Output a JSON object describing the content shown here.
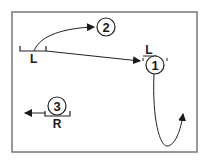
{
  "diagram": {
    "type": "play-diagram",
    "frame": {
      "x": 12,
      "y": 12,
      "width": 185,
      "height": 140,
      "stroke": "#777777"
    },
    "players": [
      {
        "id": "1",
        "label": "1",
        "cx": 155,
        "cy": 65,
        "r": 9,
        "position_label": "L"
      },
      {
        "id": "2",
        "label": "2",
        "cx": 106,
        "cy": 27,
        "r": 9
      },
      {
        "id": "3",
        "label": "3",
        "cx": 57,
        "cy": 106,
        "r": 9,
        "position_label": "R"
      }
    ],
    "markers": [
      {
        "id": "start-L",
        "label": "L"
      }
    ],
    "arrows": [
      {
        "id": "arc-to-2",
        "from": "L-marker",
        "to": "2",
        "style": "curved"
      },
      {
        "id": "line-to-1",
        "from": "L-marker",
        "to": "1",
        "style": "straight"
      },
      {
        "id": "loop-from-1",
        "from": "1",
        "style": "curved-loop"
      },
      {
        "id": "left-from-3",
        "from": "3",
        "style": "straight",
        "direction": "left"
      }
    ],
    "colors": {
      "line": "#222222",
      "frame": "#777777",
      "background": "#ffffff"
    }
  }
}
